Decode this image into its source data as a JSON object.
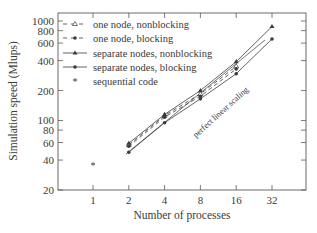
{
  "chart_data": {
    "type": "line",
    "title": "",
    "xlabel": "Number of processes",
    "ylabel": "Simulation speed (Mlups)",
    "xscale": "log2",
    "yscale": "log",
    "x_ticks": [
      1,
      2,
      4,
      8,
      16,
      32
    ],
    "x_tick_labels": [
      "1",
      "2",
      "4",
      "8",
      "16",
      "32"
    ],
    "y_ticks": [
      20,
      40,
      60,
      80,
      100,
      200,
      400,
      600,
      800,
      1000
    ],
    "y_tick_labels": [
      "20",
      "40",
      "60",
      "80",
      "100",
      "200",
      "400",
      "600",
      "800",
      "1000"
    ],
    "xlim": [
      0.6,
      50
    ],
    "ylim": [
      20,
      1300
    ],
    "grid": false,
    "legend_position": "upper left",
    "series": [
      {
        "name": "one node, nonblocking",
        "style": "dashed",
        "marker": "triangle-open",
        "x": [
          2,
          4,
          8,
          16
        ],
        "values": [
          57,
          112,
          185,
          350
        ]
      },
      {
        "name": "one node, blocking",
        "style": "dashed",
        "marker": "dot",
        "x": [
          2,
          4,
          8,
          16
        ],
        "values": [
          55,
          108,
          175,
          330
        ]
      },
      {
        "name": "separate nodes, nonblocking",
        "style": "solid",
        "marker": "triangle",
        "x": [
          2,
          4,
          8,
          16,
          32
        ],
        "values": [
          59,
          115,
          200,
          390,
          880
        ]
      },
      {
        "name": "separate nodes, blocking",
        "style": "solid",
        "marker": "dot",
        "x": [
          2,
          4,
          8,
          16,
          32
        ],
        "values": [
          48,
          95,
          165,
          295,
          660
        ]
      },
      {
        "name": "sequential code",
        "style": "none",
        "marker": "star",
        "x": [
          1
        ],
        "values": [
          36
        ]
      }
    ],
    "annotations": [
      {
        "text": "perfect linear scaling",
        "type": "reference-line",
        "rotation": -45
      }
    ]
  },
  "legend": {
    "items": [
      {
        "label": "one node, nonblocking"
      },
      {
        "label": "one node, blocking"
      },
      {
        "label": "separate nodes, nonblocking"
      },
      {
        "label": "separate nodes, blocking"
      },
      {
        "label": "sequential code"
      }
    ]
  },
  "annotation_text": "perfect linear scaling",
  "colors": {
    "ink": "#3a3a3a",
    "frame": "#5a5a5a",
    "background": "#ffffff"
  }
}
